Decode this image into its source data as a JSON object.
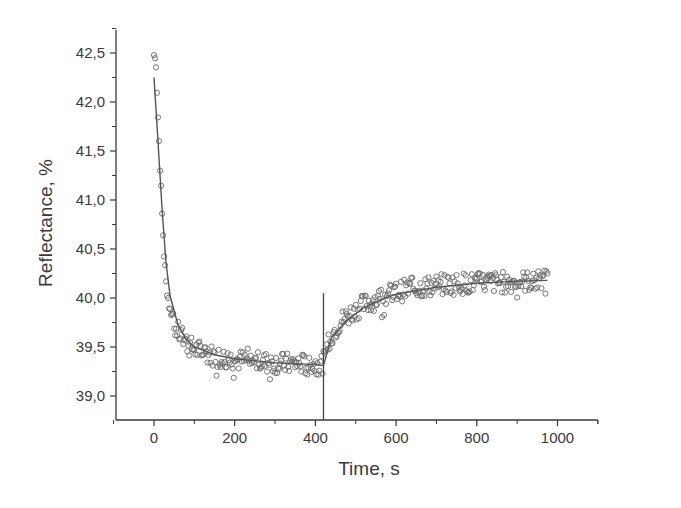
{
  "chart_data": {
    "type": "scatter",
    "title": "",
    "xlabel": "Time, s",
    "ylabel": "Reflectance, %",
    "xlim": [
      -100,
      1100
    ],
    "ylim": [
      38.75,
      42.75
    ],
    "x_ticks": [
      0,
      200,
      400,
      600,
      800,
      1000
    ],
    "x_tick_labels": [
      "0",
      "200",
      "400",
      "600",
      "800",
      "1000"
    ],
    "y_ticks": [
      39.0,
      39.5,
      40.0,
      40.5,
      41.0,
      41.5,
      42.0,
      42.5
    ],
    "y_tick_labels": [
      "39,0",
      "39,5",
      "40,0",
      "40,5",
      "41,0",
      "41,5",
      "42,0",
      "42,5"
    ],
    "grid": false,
    "legend": null,
    "annotations": [
      {
        "type": "vertical-line",
        "x": 420,
        "y_from": 38.75,
        "y_to": 40.05
      }
    ],
    "series": [
      {
        "name": "measured",
        "style": "open-circle",
        "color": "#6a6a6a",
        "x": [
          0,
          5,
          10,
          15,
          20,
          25,
          30,
          40,
          50,
          60,
          70,
          80,
          90,
          100,
          120,
          140,
          160,
          180,
          200,
          220,
          240,
          260,
          280,
          300,
          320,
          340,
          360,
          380,
          400,
          410,
          420,
          430,
          440,
          460,
          480,
          500,
          520,
          540,
          560,
          580,
          600,
          620,
          640,
          660,
          680,
          700,
          720,
          740,
          760,
          780,
          800,
          820,
          840,
          860,
          880,
          900,
          920,
          940,
          960,
          975
        ],
        "y": [
          42.48,
          42.4,
          41.85,
          41.35,
          40.85,
          40.45,
          40.15,
          39.85,
          39.7,
          39.65,
          39.6,
          39.55,
          39.5,
          39.48,
          39.45,
          39.42,
          39.4,
          39.38,
          39.37,
          39.36,
          39.35,
          39.35,
          39.34,
          39.34,
          39.33,
          39.33,
          39.33,
          39.32,
          39.32,
          39.3,
          39.35,
          39.5,
          39.62,
          39.75,
          39.82,
          39.88,
          39.93,
          39.97,
          40.0,
          40.03,
          40.06,
          40.08,
          40.1,
          40.11,
          40.12,
          40.13,
          40.14,
          40.14,
          40.15,
          40.15,
          40.15,
          40.16,
          40.16,
          40.16,
          40.16,
          40.17,
          40.17,
          40.17,
          40.18,
          40.18
        ]
      },
      {
        "name": "fit",
        "style": "line",
        "color": "#555555",
        "x": [
          0,
          10,
          20,
          30,
          40,
          60,
          80,
          100,
          150,
          200,
          300,
          400,
          420,
          440,
          480,
          520,
          560,
          600,
          700,
          800,
          900,
          975
        ],
        "y": [
          42.25,
          41.6,
          40.9,
          40.35,
          40.02,
          39.72,
          39.58,
          39.5,
          39.42,
          39.38,
          39.34,
          39.32,
          39.31,
          39.6,
          39.78,
          39.9,
          39.98,
          40.04,
          40.11,
          40.15,
          40.17,
          40.18
        ]
      }
    ]
  }
}
